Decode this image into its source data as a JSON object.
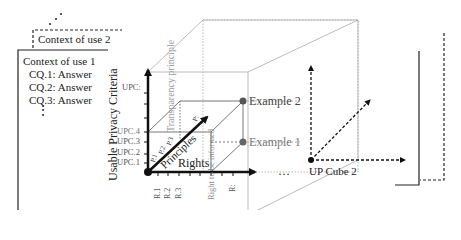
{
  "contexts": {
    "context2": {
      "title": "Context of use 2"
    },
    "context1": {
      "title": "Context of use 1",
      "questions": [
        "CQ.1: Answer",
        "CQ.2: Answer",
        "CQ.3: Answer"
      ],
      "more": "⋮"
    },
    "more_contexts": "…"
  },
  "cube1": {
    "y_axis": {
      "label": "Usable Privacy Criteria",
      "ticks": [
        "UPC.1",
        "UPC.2",
        "UPC.3",
        "UPC.4",
        "UPC:"
      ]
    },
    "x_axis": {
      "label": "Rights",
      "ticks": [
        "R.1",
        "R.2",
        "R.3",
        "Right to be informed",
        "R:"
      ]
    },
    "z_axis": {
      "label": "Principles",
      "ticks": [
        "P.1",
        "P.2",
        "P.3",
        "P:"
      ]
    },
    "plane_labels": {
      "transparency": "Transparency principle",
      "right_informed": "Right to be informed"
    },
    "examples": [
      "Example 1",
      "Example 2"
    ]
  },
  "between_cubes": "…",
  "cube2": {
    "label": "UP Cube 2"
  },
  "colors": {
    "axis": "#111111",
    "grid": "#9a9a9a",
    "point": "#555555",
    "light_text": "#888888"
  }
}
